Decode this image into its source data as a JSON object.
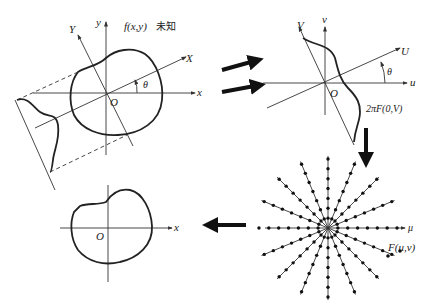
{
  "diagram": {
    "panel_spatial": {
      "function_label": "f(x,y)",
      "unknown_label": "未知",
      "axis_x": "x",
      "axis_y": "y",
      "axis_X": "X",
      "axis_Y": "Y",
      "origin": "O",
      "angle": "θ"
    },
    "panel_frequency_slice": {
      "axis_u": "u",
      "axis_v": "v",
      "axis_U": "U",
      "axis_V": "V",
      "origin": "O",
      "angle": "θ",
      "slice_label": "2πF(0,V)"
    },
    "panel_radial_samples": {
      "axis_label": "μ",
      "samples_label": "F(u,v)",
      "num_spokes": 8,
      "points_per_half_spoke": 7
    },
    "panel_reconstructed": {
      "axis_x": "x",
      "origin": "O"
    },
    "arrows": [
      {
        "name": "projection-to-slice-arrow-1",
        "direction": "right-up"
      },
      {
        "name": "projection-to-slice-arrow-2",
        "direction": "right-up"
      },
      {
        "name": "slice-to-samples-arrow",
        "direction": "down"
      },
      {
        "name": "samples-to-reconstruction-arrow",
        "direction": "left"
      }
    ]
  }
}
